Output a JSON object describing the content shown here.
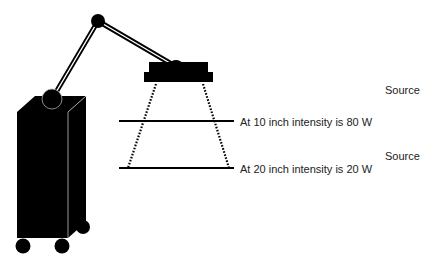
{
  "diagram": {
    "labels": {
      "source_top": "Source",
      "source_bottom": "Source",
      "distance_10": "At 10 inch intensity is 80 W",
      "distance_20": "At 20 inch intensity is 20 W"
    },
    "measurements": [
      {
        "distance_inch": 10,
        "intensity_w": 80
      },
      {
        "distance_inch": 20,
        "intensity_w": 20
      }
    ],
    "colors": {
      "ink": "#000000",
      "text": "#222222",
      "background": "#ffffff"
    }
  }
}
